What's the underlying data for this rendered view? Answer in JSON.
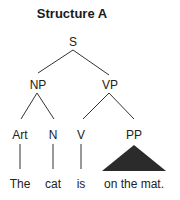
{
  "title": "Structure A",
  "tree": {
    "root": "S",
    "nodes": {
      "s": "S",
      "np": "NP",
      "vp": "VP",
      "art": "Art",
      "n": "N",
      "v": "V",
      "pp": "PP"
    },
    "words": {
      "art": "The",
      "n": "cat",
      "v": "is",
      "pp": "on the mat."
    }
  },
  "colors": {
    "line": "#333333",
    "triangle": "#2b2b2b",
    "text": "#222222"
  }
}
